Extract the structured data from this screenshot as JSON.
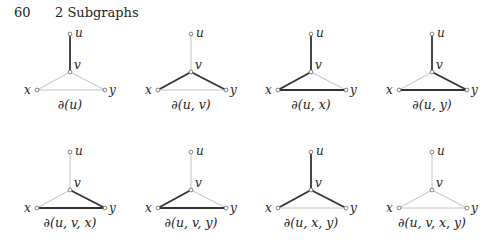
{
  "header": {
    "page_number": "60",
    "chapter_title": "2 Subgraphs"
  },
  "colors": {
    "highlight_edge": "#333333",
    "normal_edge": "#c2c2c2",
    "vertex_fill": "#ffffff",
    "vertex_stroke": "#666666"
  },
  "vertex_labels": {
    "u": "u",
    "v": "v",
    "x": "x",
    "y": "y"
  },
  "graphs": [
    {
      "caption": "∂(u)",
      "dark_edges": [
        "uv"
      ]
    },
    {
      "caption": "∂(u, v)",
      "dark_edges": [
        "vx",
        "vy"
      ]
    },
    {
      "caption": "∂(u, x)",
      "dark_edges": [
        "uv",
        "vx",
        "xy"
      ]
    },
    {
      "caption": "∂(u, y)",
      "dark_edges": [
        "uv",
        "vy",
        "xy"
      ]
    },
    {
      "caption": "∂(u, v, x)",
      "dark_edges": [
        "vy",
        "xy"
      ]
    },
    {
      "caption": "∂(u, v, y)",
      "dark_edges": [
        "vx",
        "xy"
      ]
    },
    {
      "caption": "∂(u, x, y)",
      "dark_edges": [
        "uv",
        "vx",
        "vy"
      ]
    },
    {
      "caption": "∂(u, v, x, y)",
      "dark_edges": []
    }
  ]
}
